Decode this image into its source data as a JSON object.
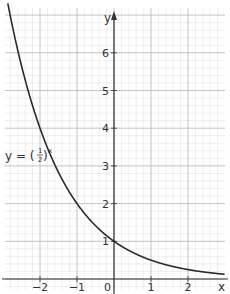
{
  "chart_data": {
    "type": "line",
    "title": "",
    "function_label": {
      "prefix": "y = (",
      "numerator": "1",
      "denominator": "2",
      "suffix": ")",
      "exponent": "x"
    },
    "xlabel": "x",
    "ylabel": "y",
    "xlim": [
      -3,
      3
    ],
    "ylim": [
      0,
      7
    ],
    "x_ticks": [
      -2,
      -1,
      0,
      1,
      2
    ],
    "x_tick_labels": [
      "−2",
      "−1",
      "0",
      "1",
      "2"
    ],
    "y_ticks": [
      1,
      2,
      3,
      4,
      5,
      6
    ],
    "y_tick_labels": [
      "1",
      "2",
      "3",
      "4",
      "5",
      "6"
    ],
    "grid": true,
    "grid_major_step": 1,
    "grid_minor_step": 0.2,
    "series": [
      {
        "name": "y = (1/2)^x",
        "formula": "0.5^x",
        "x": [
          -2.9,
          -2.5,
          -2,
          -1.5,
          -1,
          -0.5,
          0,
          0.5,
          1,
          1.5,
          2,
          2.5,
          3
        ],
        "values": [
          7.46,
          5.66,
          4,
          2.83,
          2,
          1.41,
          1,
          0.71,
          0.5,
          0.35,
          0.25,
          0.18,
          0.125
        ]
      }
    ],
    "colors": {
      "curve": "#2a2a2a",
      "axis": "#333333",
      "grid_major": "#b5b5b5",
      "grid_minor": "#dedede"
    }
  }
}
